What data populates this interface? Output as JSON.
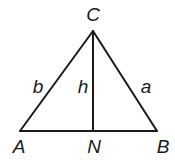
{
  "diagram": {
    "type": "triangle-with-altitude",
    "vertices": [
      {
        "name": "C",
        "label": "C",
        "x": 93,
        "y": 31
      },
      {
        "name": "A",
        "label": "A",
        "x": 20,
        "y": 131
      },
      {
        "name": "B",
        "label": "B",
        "x": 157,
        "y": 131
      },
      {
        "name": "N",
        "label": "N",
        "x": 93,
        "y": 131
      }
    ],
    "sides": [
      {
        "name": "b",
        "label": "b",
        "from": "A",
        "to": "C"
      },
      {
        "name": "a",
        "label": "a",
        "from": "C",
        "to": "B"
      },
      {
        "name": "base",
        "label": "",
        "from": "A",
        "to": "B"
      },
      {
        "name": "h",
        "label": "h",
        "from": "C",
        "to": "N"
      }
    ],
    "labels": {
      "C": "C",
      "A": "A",
      "B": "B",
      "N": "N",
      "b": "b",
      "h": "h",
      "a": "a"
    },
    "colors": {
      "stroke": "#1a1a1a",
      "background": "#ffffff"
    }
  }
}
